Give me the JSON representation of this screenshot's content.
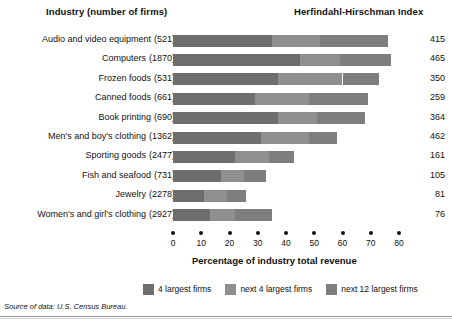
{
  "headers": {
    "industry": "Industry (number of firms)",
    "hhi": "Herfindahl-Hirschman Index"
  },
  "footer": {
    "source": "Source of data: U.S. Census Bureau."
  },
  "legend": {
    "items": [
      {
        "label": "4 largest firms",
        "color": "#6e6e6e"
      },
      {
        "label": "next 4 largest firms",
        "color": "#8f8f8f"
      },
      {
        "label": "next 12 largest firms",
        "color": "#7e7e7e"
      }
    ]
  },
  "chart_data": {
    "type": "bar",
    "orientation": "horizontal",
    "stacked": true,
    "title": "",
    "xlabel": "Percentage of industry total revenue",
    "ylabel": "",
    "xlim": [
      0,
      80
    ],
    "xticks": [
      0,
      10,
      20,
      30,
      40,
      50,
      60,
      70,
      80
    ],
    "xticklabels": [
      "0",
      "10",
      "20",
      "30",
      "40",
      "50",
      "60",
      "70",
      "80"
    ],
    "grid": false,
    "legend_position": "bottom",
    "categories": [
      "Audio and video equipment",
      "Computers",
      "Frozen foods",
      "Canned foods",
      "Book printing",
      "Men's and boy's clothing",
      "Sporting goods",
      "Fish and seafood",
      "Jewelry",
      "Women's and girl's clothing"
    ],
    "firm_counts": [
      "(521)",
      "(1870)",
      "(531)",
      "(661)",
      "(690)",
      "(1362)",
      "(2477)",
      "(731)",
      "(2278)",
      "(2927)"
    ],
    "hhi_values": [
      415,
      465,
      350,
      259,
      364,
      462,
      161,
      105,
      81,
      76
    ],
    "series": [
      {
        "name": "4 largest firms",
        "values": [
          35,
          45,
          37,
          29,
          37,
          31,
          22,
          17,
          11,
          13
        ]
      },
      {
        "name": "next 4 largest firms",
        "values": [
          17,
          14,
          23,
          19,
          14,
          17,
          12,
          8,
          8,
          9
        ]
      },
      {
        "name": "next 12 largest firms",
        "values": [
          24,
          18,
          13,
          21,
          17,
          10,
          9,
          8,
          7,
          13
        ]
      }
    ],
    "totals": [
      76,
      77,
      73,
      69,
      68,
      58,
      43,
      33,
      26,
      35
    ],
    "rows": [
      {
        "label": "Audio and video equipment",
        "firms": "(521)",
        "hhi": 415,
        "s1": 35,
        "s2": 17,
        "s3": 24
      },
      {
        "label": "Computers",
        "firms": "(1870)",
        "hhi": 465,
        "s1": 45,
        "s2": 14,
        "s3": 18
      },
      {
        "label": "Frozen foods",
        "firms": "(531)",
        "hhi": 350,
        "s1": 37,
        "s2": 23,
        "s3": 13
      },
      {
        "label": "Canned foods",
        "firms": "(661)",
        "hhi": 259,
        "s1": 29,
        "s2": 19,
        "s3": 21
      },
      {
        "label": "Book printing",
        "firms": "(690)",
        "hhi": 364,
        "s1": 37,
        "s2": 14,
        "s3": 17
      },
      {
        "label": "Men's and boy's clothing",
        "firms": "(1362)",
        "hhi": 462,
        "s1": 31,
        "s2": 17,
        "s3": 10
      },
      {
        "label": "Sporting goods",
        "firms": "(2477)",
        "hhi": 161,
        "s1": 22,
        "s2": 12,
        "s3": 9
      },
      {
        "label": "Fish and seafood",
        "firms": "(731)",
        "hhi": 105,
        "s1": 17,
        "s2": 8,
        "s3": 8
      },
      {
        "label": "Jewelry",
        "firms": "(2278)",
        "hhi": 81,
        "s1": 11,
        "s2": 8,
        "s3": 7
      },
      {
        "label": "Women's and girl's clothing",
        "firms": "(2927)",
        "hhi": 76,
        "s1": 13,
        "s2": 9,
        "s3": 13
      }
    ]
  }
}
